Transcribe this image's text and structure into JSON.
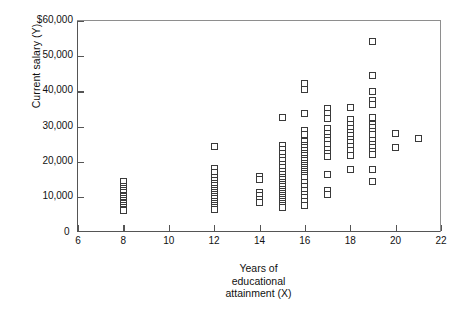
{
  "chart_data": {
    "type": "scatter",
    "title": "",
    "xlabel": "Years of educational attainment (X)",
    "xlabel_lines": [
      "Years of",
      "educational",
      "attainment (X)"
    ],
    "ylabel": "Current salary (Y)",
    "xlim": [
      6,
      22
    ],
    "ylim": [
      0,
      60000
    ],
    "xticks": [
      6,
      8,
      10,
      12,
      14,
      16,
      18,
      20,
      22
    ],
    "xtick_labels": [
      "6",
      "8",
      "10",
      "12",
      "14",
      "16",
      "18",
      "20",
      "22"
    ],
    "yticks": [
      0,
      10000,
      20000,
      30000,
      40000,
      50000,
      60000
    ],
    "ytick_labels": [
      "0",
      "10,000",
      "20,000",
      "30,000",
      "40,000",
      "50,000",
      "$60,000"
    ],
    "grid": false,
    "legend": null,
    "marker": "open-square",
    "marker_color": "#3a3a3a",
    "marker_fill": "#ffffff",
    "series": [
      {
        "name": "Employees",
        "points": [
          [
            8,
            14500
          ],
          [
            8,
            13000
          ],
          [
            8,
            12300
          ],
          [
            8,
            11700
          ],
          [
            8,
            11100
          ],
          [
            8,
            10500
          ],
          [
            8,
            10000
          ],
          [
            8,
            9500
          ],
          [
            8,
            9000
          ],
          [
            8,
            8500
          ],
          [
            8,
            8000
          ],
          [
            8,
            7500
          ],
          [
            8,
            7000
          ],
          [
            8,
            6500
          ],
          [
            8,
            6100
          ],
          [
            12,
            24400
          ],
          [
            12,
            18000
          ],
          [
            12,
            17000
          ],
          [
            12,
            15500
          ],
          [
            12,
            14600
          ],
          [
            12,
            13800
          ],
          [
            12,
            13100
          ],
          [
            12,
            12400
          ],
          [
            12,
            11800
          ],
          [
            12,
            11200
          ],
          [
            12,
            10600
          ],
          [
            12,
            10000
          ],
          [
            12,
            9400
          ],
          [
            12,
            8800
          ],
          [
            12,
            8200
          ],
          [
            12,
            7600
          ],
          [
            12,
            7000
          ],
          [
            12,
            6500
          ],
          [
            14,
            15800
          ],
          [
            14,
            15000
          ],
          [
            14,
            11200
          ],
          [
            14,
            10300
          ],
          [
            14,
            9300
          ],
          [
            14,
            8300
          ],
          [
            15,
            32600
          ],
          [
            15,
            24700
          ],
          [
            15,
            23500
          ],
          [
            15,
            22400
          ],
          [
            15,
            21300
          ],
          [
            15,
            20200
          ],
          [
            15,
            19200
          ],
          [
            15,
            18200
          ],
          [
            15,
            17300
          ],
          [
            15,
            16400
          ],
          [
            15,
            15600
          ],
          [
            15,
            14800
          ],
          [
            15,
            14100
          ],
          [
            15,
            13400
          ],
          [
            15,
            12800
          ],
          [
            15,
            12200
          ],
          [
            15,
            11600
          ],
          [
            15,
            11000
          ],
          [
            15,
            10400
          ],
          [
            15,
            9800
          ],
          [
            15,
            9200
          ],
          [
            15,
            8600
          ],
          [
            15,
            8000
          ],
          [
            15,
            7400
          ],
          [
            15,
            6900
          ],
          [
            16,
            42200
          ],
          [
            16,
            40500
          ],
          [
            16,
            33700
          ],
          [
            16,
            29000
          ],
          [
            16,
            27800
          ],
          [
            16,
            25800
          ],
          [
            16,
            24700
          ],
          [
            16,
            23900
          ],
          [
            16,
            23100
          ],
          [
            16,
            22400
          ],
          [
            16,
            21700
          ],
          [
            16,
            21000
          ],
          [
            16,
            20300
          ],
          [
            16,
            19600
          ],
          [
            16,
            19000
          ],
          [
            16,
            18400
          ],
          [
            16,
            17800
          ],
          [
            16,
            17200
          ],
          [
            16,
            16600
          ],
          [
            16,
            16000
          ],
          [
            16,
            15400
          ],
          [
            16,
            14200
          ],
          [
            16,
            13000
          ],
          [
            16,
            11900
          ],
          [
            16,
            10800
          ],
          [
            16,
            9700
          ],
          [
            16,
            8600
          ],
          [
            16,
            7500
          ],
          [
            17,
            35000
          ],
          [
            17,
            33600
          ],
          [
            17,
            32300
          ],
          [
            17,
            29300
          ],
          [
            17,
            28000
          ],
          [
            17,
            27000
          ],
          [
            17,
            26000
          ],
          [
            17,
            25000
          ],
          [
            17,
            23600
          ],
          [
            17,
            22400
          ],
          [
            17,
            21400
          ],
          [
            17,
            16300
          ],
          [
            17,
            11900
          ],
          [
            17,
            10700
          ],
          [
            18,
            35300
          ],
          [
            18,
            31900
          ],
          [
            18,
            30500
          ],
          [
            18,
            29400
          ],
          [
            18,
            28400
          ],
          [
            18,
            27400
          ],
          [
            18,
            26400
          ],
          [
            18,
            25400
          ],
          [
            18,
            24400
          ],
          [
            18,
            23200
          ],
          [
            18,
            21800
          ],
          [
            18,
            17700
          ],
          [
            19,
            54300
          ],
          [
            19,
            44400
          ],
          [
            19,
            39900
          ],
          [
            19,
            37300
          ],
          [
            19,
            36300
          ],
          [
            19,
            32600
          ],
          [
            19,
            30600
          ],
          [
            19,
            29600
          ],
          [
            19,
            28600
          ],
          [
            19,
            27600
          ],
          [
            19,
            26000
          ],
          [
            19,
            24900
          ],
          [
            19,
            24100
          ],
          [
            19,
            22900
          ],
          [
            19,
            22000
          ],
          [
            19,
            17800
          ],
          [
            19,
            14300
          ],
          [
            20,
            27900
          ],
          [
            20,
            23900
          ],
          [
            21,
            26500
          ]
        ]
      }
    ]
  }
}
